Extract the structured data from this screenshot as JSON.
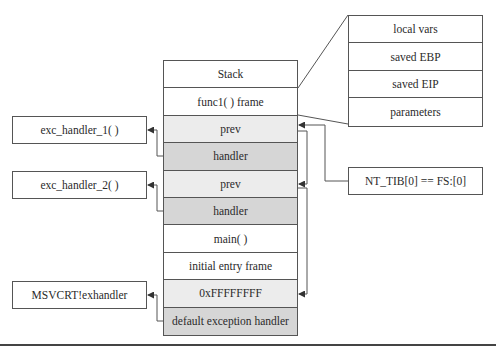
{
  "stack": {
    "rows": [
      {
        "label": "Stack",
        "shade": "plain"
      },
      {
        "label": "func1( ) frame",
        "shade": "plain"
      },
      {
        "label": "prev",
        "shade": "light"
      },
      {
        "label": "handler",
        "shade": "dark"
      },
      {
        "label": "prev",
        "shade": "light"
      },
      {
        "label": "handler",
        "shade": "dark"
      },
      {
        "label": "main( )",
        "shade": "plain"
      },
      {
        "label": "initial entry frame",
        "shade": "plain"
      },
      {
        "label": "0xFFFFFFFF",
        "shade": "light"
      },
      {
        "label": "default exception handler",
        "shade": "dark"
      }
    ]
  },
  "frame_detail": {
    "rows": [
      "local vars",
      "saved EBP",
      "saved EIP",
      "parameters"
    ]
  },
  "handlers": {
    "handler_1": "exc_handler_1( )",
    "handler_2": "exc_handler_2( )",
    "handler_default": "MSVCRT!exhandler"
  },
  "tib": {
    "label": "NT_TIB[0] == FS:[0]"
  },
  "colors": {
    "line": "#555555",
    "light_fill": "#ececec",
    "dark_fill": "#d6d6d6"
  }
}
